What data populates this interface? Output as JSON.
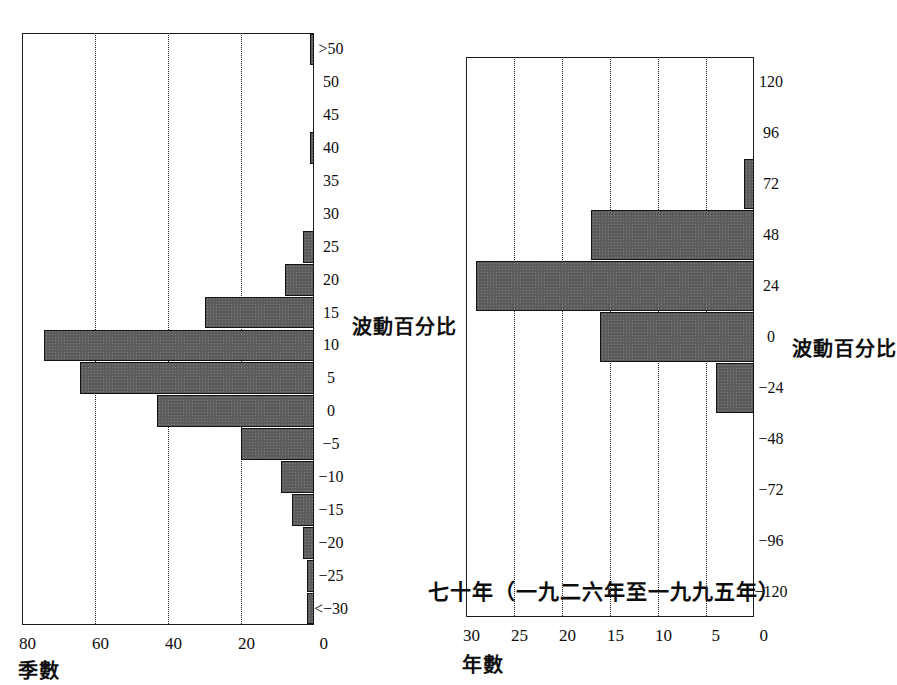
{
  "page": {
    "background_color": "#ffffff",
    "ink_color": "#0d0d0d",
    "bar_fill_color": "#5c5c5c",
    "bar_edge_color": "#121212",
    "orientation_note": "90-degree rotated scan"
  },
  "chart_data": [
    {
      "id": "left",
      "type": "bar",
      "title": "",
      "subtitle": "",
      "xlabel": "波動百分比",
      "ylabel": "季數",
      "ylim": [
        0,
        80
      ],
      "yticks": [
        0,
        20,
        40,
        60,
        80
      ],
      "grid": true,
      "grid_axis": "value",
      "legend": "none",
      "categories": [
        "<−30",
        "−25",
        "−20",
        "−15",
        "−10",
        "−5",
        "0",
        "5",
        "10",
        "15",
        "20",
        "25",
        "30",
        "35",
        "40",
        "45",
        "50",
        ">50"
      ],
      "values": [
        2,
        2,
        3,
        6,
        9,
        20,
        43,
        64,
        74,
        30,
        8,
        3,
        0,
        0,
        1,
        0,
        0,
        1
      ]
    },
    {
      "id": "right",
      "type": "bar",
      "title": "七十年（一九二六年至一九九五年）",
      "subtitle": "",
      "xlabel": "波動百分比",
      "ylabel": "年數",
      "ylim": [
        0,
        30
      ],
      "yticks": [
        0,
        5,
        10,
        15,
        20,
        25,
        30
      ],
      "grid": true,
      "grid_axis": "value",
      "legend": "none",
      "categories": [
        "−120",
        "−96",
        "−72",
        "−48",
        "−24",
        "0",
        "24",
        "48",
        "72",
        "96",
        "120"
      ],
      "values": [
        0,
        0,
        0,
        0,
        4,
        16,
        29,
        17,
        1,
        0,
        0
      ]
    }
  ],
  "labels": {
    "left_chart": {
      "value_axis_name": "季數",
      "category_axis_name": "波動百分比",
      "value_ticks": [
        "80",
        "60",
        "40",
        "20",
        "0"
      ],
      "category_ticks": [
        ">50",
        "50",
        "45",
        "40",
        "35",
        "30",
        "25",
        "20",
        "15",
        "10",
        "5",
        "0",
        "−5",
        "−10",
        "−15",
        "−20",
        "−25",
        "<−30"
      ]
    },
    "right_chart": {
      "title": "七十年（一九二六年至一九九五年）",
      "value_axis_name": "年數",
      "category_axis_name": "波動百分比",
      "value_ticks": [
        "30",
        "25",
        "20",
        "15",
        "10",
        "5",
        "0"
      ],
      "category_ticks": [
        "120",
        "96",
        "72",
        "48",
        "24",
        "0",
        "−24",
        "−48",
        "−72",
        "−96",
        "−120"
      ]
    }
  }
}
